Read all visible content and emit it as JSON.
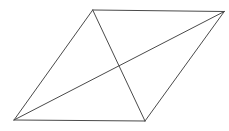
{
  "diagram": {
    "type": "parallelogram-with-diagonals",
    "stroke_color": "#4a4a4a",
    "stroke_width": 1,
    "vertices": {
      "top_left": [
        92.7,
        10
      ],
      "top_right": [
        224.3,
        11.5
      ],
      "bottom_right": [
        145,
        121
      ],
      "bottom_left": [
        14,
        120
      ]
    },
    "edges": [
      {
        "name": "top-edge",
        "from": "top_left",
        "to": "top_right"
      },
      {
        "name": "right-edge",
        "from": "top_right",
        "to": "bottom_right"
      },
      {
        "name": "bottom-edge",
        "from": "bottom_right",
        "to": "bottom_left"
      },
      {
        "name": "left-edge",
        "from": "bottom_left",
        "to": "top_left"
      }
    ],
    "diagonals": [
      {
        "name": "diagonal-bl-tr",
        "from": "bottom_left",
        "to": "top_right"
      },
      {
        "name": "diagonal-tl-br",
        "from": "top_left",
        "to": "bottom_right"
      }
    ]
  }
}
